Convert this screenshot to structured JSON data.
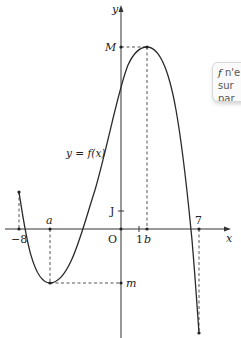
{
  "graph": {
    "axes": {
      "x_label": "x",
      "y_label": "y",
      "origin_label": "O",
      "x_unit_label": "1",
      "y_unit_label": "J"
    },
    "x_ticks": {
      "minus8": "−8",
      "a": "a",
      "b": "b",
      "seven": "7"
    },
    "y_ticks": {
      "M": "M",
      "m": "m"
    },
    "curve_label": "y = f(x)"
  },
  "callout": {
    "line1_f": "f",
    "line1_rest": " n'e",
    "line2": "sur",
    "line3": "par"
  },
  "colors": {
    "curve": "#2a2a2a",
    "axis": "#333333",
    "dash": "#555555"
  }
}
